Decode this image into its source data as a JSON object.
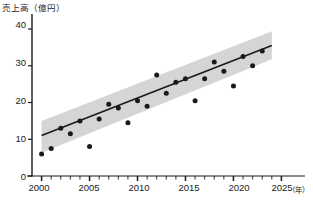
{
  "chart_data": {
    "type": "scatter",
    "title": "",
    "subtitle": "",
    "ylabel": "売上高（億円）",
    "xlabel": "",
    "x_unit": "（年）",
    "xlim": [
      1999,
      2026
    ],
    "ylim": [
      0,
      43
    ],
    "grid": false,
    "legend": "none",
    "x_ticks_major": [
      2000,
      2005,
      2010,
      2015,
      2020,
      2025
    ],
    "x_tick_labels": [
      "2000",
      "2005",
      "2010",
      "2015",
      "2020",
      "2025"
    ],
    "x_ticks_minor_step": 1,
    "y_ticks": [
      0,
      10,
      20,
      30,
      40
    ],
    "y_tick_labels": [
      "0",
      "10",
      "20",
      "30",
      "40"
    ],
    "point_color": "#1a1a1a",
    "line_color": "#1a1a1a",
    "band_color": "#d5d5d5",
    "axis_color": "#1a1a1a",
    "x": [
      2000,
      2001,
      2002,
      2003,
      2004,
      2005,
      2006,
      2007,
      2008,
      2009,
      2010,
      2011,
      2012,
      2013,
      2014,
      2015,
      2016,
      2017,
      2018,
      2019,
      2020,
      2021,
      2022,
      2023
    ],
    "values": [
      6.0,
      7.5,
      13.0,
      11.5,
      15.0,
      8.0,
      15.5,
      19.5,
      18.5,
      14.5,
      20.5,
      19.0,
      27.5,
      22.5,
      25.5,
      26.5,
      20.5,
      26.5,
      31.0,
      28.5,
      24.5,
      32.5,
      30.0,
      34.0
    ],
    "series_name": "売上高",
    "trend_line": {
      "type": "linear_regression",
      "x_start": 2000,
      "x_end": 2024,
      "y_start": 11.0,
      "y_end": 35.5
    },
    "confidence_band": {
      "x_start": 2000,
      "x_end": 2024,
      "lower_start": 6.3,
      "upper_start": 15.0,
      "lower_end": 31.8,
      "upper_end": 39.4
    }
  }
}
